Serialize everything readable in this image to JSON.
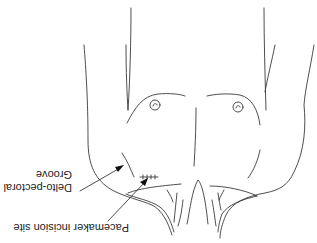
{
  "figure": {
    "orientation": "rotated 180 degrees",
    "labels": {
      "groove_line1": "Delto-pectoral",
      "groove_line2": "Groove",
      "incision": "Pacemaker incision site"
    },
    "colors": {
      "line": "#3a3a3a",
      "background": "#ffffff"
    }
  }
}
